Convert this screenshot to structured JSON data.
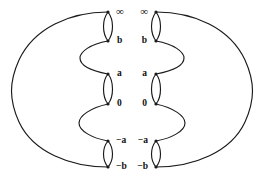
{
  "figure": {
    "type": "branch-cut-diagram",
    "title": "",
    "background_color": "#ffffff",
    "stroke_color": "#1a1a1a",
    "label_color": "#111111",
    "width": 264,
    "height": 177,
    "sheets": [
      {
        "name": "left-sheet",
        "side": "left",
        "outer_boundary": "large arc bulging to the left from the top branch point to the bottom branch point",
        "inner_boundary": "scalloped curve with three lens-shaped branch cuts"
      },
      {
        "name": "right-sheet",
        "side": "right",
        "outer_boundary": "large arc bulging to the right from the top branch point to the bottom branch point",
        "inner_boundary": "scalloped curve with three lens-shaped branch cuts"
      }
    ],
    "cuts": [
      {
        "id": "cut-top",
        "top_label": "∞",
        "bottom_label": "b",
        "top_label_name": "label-infinity",
        "bottom_label_name": "label-b"
      },
      {
        "id": "cut-middle",
        "top_label": "a",
        "bottom_label": "0",
        "top_label_name": "label-a",
        "bottom_label_name": "label-zero"
      },
      {
        "id": "cut-bottom",
        "top_label": "−a",
        "bottom_label": "−b",
        "top_label_name": "label-minus-a",
        "bottom_label_name": "label-minus-b"
      }
    ],
    "labels_left": {
      "infinity": "∞",
      "b": "b",
      "a": "a",
      "zero": "0",
      "minus_a": "−a",
      "minus_b": "−b"
    },
    "labels_right": {
      "infinity": "∞",
      "b": "b",
      "a": "a",
      "zero": "0",
      "minus_a": "−a",
      "minus_b": "−b"
    }
  }
}
